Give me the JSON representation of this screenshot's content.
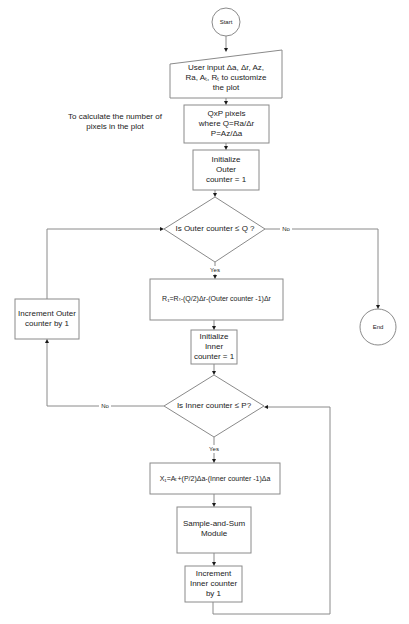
{
  "diagram": {
    "type": "flowchart",
    "colors": {
      "stroke": "#8a8a8a",
      "arrow": "#1a1a1a",
      "text": "#222222",
      "background": "#ffffff"
    },
    "nodes": {
      "start": {
        "shape": "circle",
        "label": "Start"
      },
      "input": {
        "shape": "manual-input",
        "label": "User input Δa, Δr, Az,\nRa, Aₜ, Rₜ to customize\nthe plot"
      },
      "pixels": {
        "shape": "process",
        "label": "QxP pixels\nwhere Q=Ra/Δr\nP=Az/Δa"
      },
      "init_outer": {
        "shape": "process",
        "label": "Initialize\nOuter\ncounter = 1"
      },
      "decision_outer": {
        "shape": "decision",
        "label": "Is Outer counter ≤ Q ?"
      },
      "r1": {
        "shape": "process",
        "label": "R₁=Rₜ-(Q/2)Δr-(Outer counter -1)Δr"
      },
      "init_inner": {
        "shape": "process",
        "label": "Initialize\nInner\ncounter = 1"
      },
      "decision_inner": {
        "shape": "decision",
        "label": "Is Inner counter ≤ P?"
      },
      "x1": {
        "shape": "process",
        "label": "X₁=Aₜ+(P/2)Δa-(Inner counter -1)Δa"
      },
      "sample_sum": {
        "shape": "process",
        "label": "Sample-and-Sum\nModule"
      },
      "inc_inner": {
        "shape": "process",
        "label": "Increment\nInner counter\nby 1"
      },
      "inc_outer": {
        "shape": "process",
        "label": "Increment Outer\ncounter by 1"
      },
      "end": {
        "shape": "circle",
        "label": "End"
      }
    },
    "annotations": {
      "pixels_note": "To calculate the number of\npixels in the plot"
    },
    "edge_labels": {
      "outer_no": "No",
      "outer_yes": "Yes",
      "inner_no": "No",
      "inner_yes": "Yes"
    },
    "edges": [
      {
        "from": "start",
        "to": "input"
      },
      {
        "from": "input",
        "to": "pixels"
      },
      {
        "from": "pixels",
        "to": "init_outer"
      },
      {
        "from": "init_outer",
        "to": "decision_outer"
      },
      {
        "from": "decision_outer",
        "to": "r1",
        "label": "Yes"
      },
      {
        "from": "decision_outer",
        "to": "end",
        "label": "No"
      },
      {
        "from": "r1",
        "to": "init_inner"
      },
      {
        "from": "init_inner",
        "to": "decision_inner"
      },
      {
        "from": "decision_inner",
        "to": "x1",
        "label": "Yes"
      },
      {
        "from": "decision_inner",
        "to": "inc_outer",
        "label": "No"
      },
      {
        "from": "x1",
        "to": "sample_sum"
      },
      {
        "from": "sample_sum",
        "to": "inc_inner"
      },
      {
        "from": "inc_inner",
        "to": "decision_inner"
      },
      {
        "from": "inc_outer",
        "to": "decision_outer"
      }
    ]
  }
}
